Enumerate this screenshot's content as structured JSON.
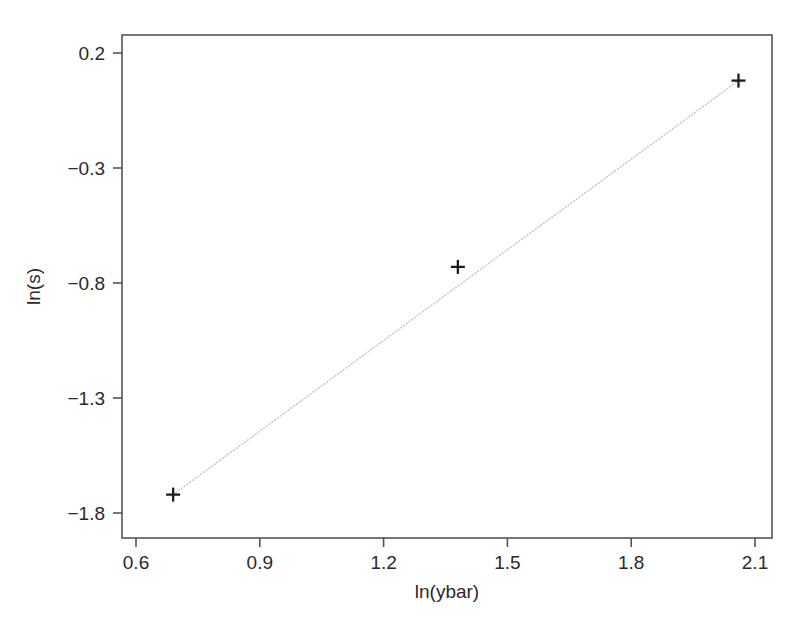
{
  "chart_data": {
    "type": "scatter",
    "title": "",
    "subtitle": "",
    "xlabel": "ln(ybar)",
    "ylabel": "ln(s)",
    "xlim": [
      0.5,
      2.2
    ],
    "ylim": [
      -1.95,
      0.29
    ],
    "grid": false,
    "legend": null,
    "xticks": [
      0.6,
      0.9,
      1.2,
      1.5,
      1.8,
      2.1
    ],
    "xtick_labels": [
      "0.6",
      "0.9",
      "1.2",
      "1.5",
      "1.8",
      "2.1"
    ],
    "yticks": [
      0.2,
      -0.3,
      -0.8,
      -1.3,
      -1.8
    ],
    "ytick_labels": [
      "0.2",
      "-0.3",
      "-0.8",
      "-1.3",
      "-1.8"
    ],
    "marker": "plus",
    "marker_color": "#1c1c1c",
    "line_color": "#c9c9c9",
    "line_style": "dotted",
    "frame_color": "#555555",
    "background": "#ffffff",
    "points": [
      {
        "x": 0.69,
        "y": -1.72
      },
      {
        "x": 1.38,
        "y": -0.73
      },
      {
        "x": 2.06,
        "y": 0.08
      }
    ],
    "series": [
      {
        "name": "observations",
        "x": [
          0.69,
          1.38,
          2.06
        ],
        "values": [
          -1.72,
          -0.73,
          0.08
        ]
      },
      {
        "name": "fitted-line",
        "x": [
          0.69,
          2.06
        ],
        "values": [
          -1.72,
          0.08
        ]
      }
    ]
  }
}
